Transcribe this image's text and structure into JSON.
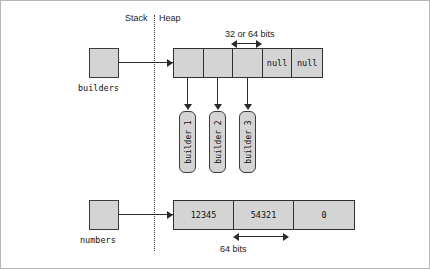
{
  "figure": {
    "zones": {
      "stack_label": "Stack",
      "heap_label": "Heap"
    },
    "stack_variables": [
      {
        "name": "builders"
      },
      {
        "name": "numbers"
      }
    ],
    "heap": {
      "builders_array": {
        "cells": [
          "",
          "",
          "",
          "null",
          "null"
        ],
        "width_annotation": "32 or 64 bits"
      },
      "objects": [
        {
          "label": "builder 1"
        },
        {
          "label": "builder 2"
        },
        {
          "label": "builder 3"
        }
      ],
      "numbers_array": {
        "cells": [
          "12345",
          "54321",
          "0"
        ],
        "width_annotation": "64 bits"
      }
    },
    "colors": {
      "box_fill": "#d4d4d4",
      "box_border": "#3b3b3b",
      "line": "#2b2b2b",
      "divider": "#3a3a3a",
      "background": "#ffffff"
    }
  }
}
